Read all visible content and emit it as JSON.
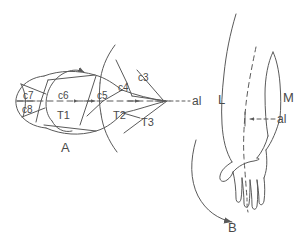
{
  "figure": {
    "background": "#ffffff",
    "ink": "#5a5a5a",
    "width": 305,
    "height": 236
  },
  "panel_a": {
    "caption": "A",
    "axis_label": "al",
    "dermatome_labels": [
      {
        "id": "c7",
        "text": "c7",
        "x": 28,
        "y": 95
      },
      {
        "id": "c8",
        "text": "c8",
        "x": 27,
        "y": 110
      },
      {
        "id": "c6",
        "text": "c6",
        "x": 65,
        "y": 96
      },
      {
        "id": "c5",
        "text": "c5",
        "x": 105,
        "y": 96
      },
      {
        "id": "c4",
        "text": "c4",
        "x": 124,
        "y": 88
      },
      {
        "id": "c3",
        "text": "c3",
        "x": 145,
        "y": 79
      },
      {
        "id": "T1",
        "text": "T1",
        "x": 64,
        "y": 114
      },
      {
        "id": "T2",
        "text": "T2",
        "x": 120,
        "y": 114
      },
      {
        "id": "T3",
        "text": "T3",
        "x": 148,
        "y": 120
      }
    ]
  },
  "panel_b": {
    "caption": "B",
    "axis_label": "al",
    "side_labels": [
      {
        "id": "L",
        "text": "L",
        "x": 224,
        "y": 100
      },
      {
        "id": "M",
        "text": "M",
        "x": 285,
        "y": 98
      }
    ]
  }
}
